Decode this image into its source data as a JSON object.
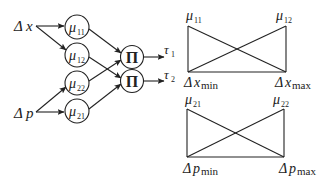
{
  "network": {
    "inputs": [
      {
        "id": "dx",
        "symbol": "Δx",
        "greek": "Δ",
        "var": "x"
      },
      {
        "id": "dp",
        "symbol": "Δp",
        "greek": "Δ",
        "var": "p"
      }
    ],
    "membership_nodes": [
      {
        "id": "mu11",
        "greek": "μ",
        "sub": "11"
      },
      {
        "id": "mu12",
        "greek": "μ",
        "sub": "12"
      },
      {
        "id": "mu22",
        "greek": "μ",
        "sub": "22"
      },
      {
        "id": "mu21",
        "greek": "μ",
        "sub": "21"
      }
    ],
    "product_nodes": [
      {
        "id": "pi1",
        "symbol": "Π"
      },
      {
        "id": "pi2",
        "symbol": "Π"
      }
    ],
    "outputs": [
      {
        "id": "tau1",
        "greek": "τ",
        "sub": "1"
      },
      {
        "id": "tau2",
        "greek": "τ",
        "sub": "2"
      }
    ]
  },
  "membership_plots": [
    {
      "id": "dx-plot",
      "top_left_label": {
        "greek": "μ",
        "sub": "11"
      },
      "top_right_label": {
        "greek": "μ",
        "sub": "12"
      },
      "bottom_left_label": {
        "greek": "Δ",
        "var": "x",
        "sub": "min"
      },
      "bottom_right_label": {
        "greek": "Δ",
        "var": "x",
        "sub": "max"
      }
    },
    {
      "id": "dp-plot",
      "top_left_label": {
        "greek": "μ",
        "sub": "21"
      },
      "top_right_label": {
        "greek": "μ",
        "sub": "22"
      },
      "bottom_left_label": {
        "greek": "Δ",
        "var": "p",
        "sub": "min"
      },
      "bottom_right_label": {
        "greek": "Δ",
        "var": "p",
        "sub": "max"
      }
    }
  ]
}
